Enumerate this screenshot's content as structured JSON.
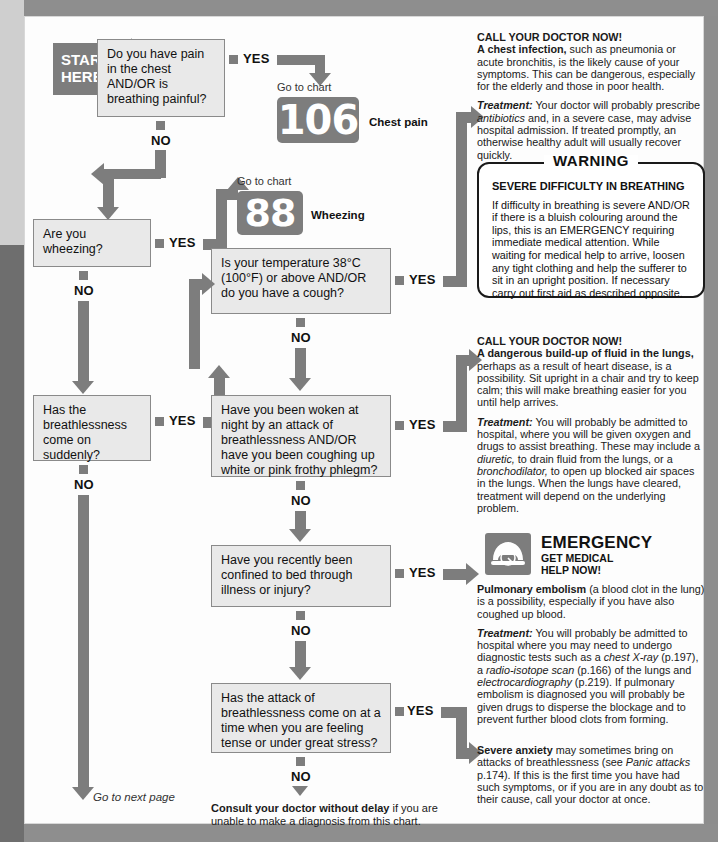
{
  "chart": {
    "start_label": "START\nHERE",
    "goto_next_page": "Go to next page",
    "yes": "YES",
    "no": "NO",
    "goto_chart": "Go to chart"
  },
  "questions": {
    "q1": "Do you have pain in the chest AND/OR is breathing painful?",
    "q2": "Are you wheezing?",
    "q3": "Is your temperature 38°C (100°F) or above AND/OR do you have a cough?",
    "q4": "Has the breathlessness come on suddenly?",
    "q5": "Have you been woken at night by an attack of breathlessness AND/OR have you been coughing up white or pink frothy phlegm?",
    "q6": "Have you recently been confined to bed through illness or injury?",
    "q7": "Has the attack of breathlessness come on at a time when you are feeling tense or under great stress?"
  },
  "refs": {
    "chart106_number": "106",
    "chart106_name": "Chest pain",
    "chart88_number": "88",
    "chart88_name": "Wheezing"
  },
  "advice": {
    "chest_infection": {
      "call": "CALL YOUR DOCTOR NOW!",
      "lead_bold": "A chest infection,",
      "lead_rest": " such as pneumonia or acute bronchitis, is the likely cause of your symptoms. This can be dangerous, especially for the elderly and those in poor health.",
      "treatment_label": "Treatment:",
      "treatment_1": " Your doctor will probably prescribe ",
      "treatment_italic": "antibiotics",
      "treatment_2": " and, in a severe case, may advise hospital admission. If treated promptly, an otherwise healthy adult will usually recover quickly."
    },
    "warning": {
      "title": "WARNING",
      "subtitle": "SEVERE DIFFICULTY IN BREATHING",
      "body": "If difficulty in breathing is severe AND/OR if there is a bluish colouring around the lips, this is an EMERGENCY requiring immediate medical attention. While waiting for medical help to arrive, loosen any tight clothing and help the sufferer to sit in an upright position. If necessary carry out first aid as described opposite."
    },
    "pulmonary_oedema": {
      "call": "CALL YOUR DOCTOR NOW!",
      "lead_bold": "A dangerous build-up of fluid in the lungs,",
      "lead_rest": " perhaps as a result of heart disease, is a possibility. Sit upright in a chair and try to keep calm; this will make breathing easier for you until help arrives.",
      "treatment_label": "Treatment:",
      "treatment_1": " You will probably be admitted to hospital, where you will be given oxygen and drugs to assist breathing. These may include a ",
      "treatment_italic_1": "diuretic,",
      "treatment_2": " to drain fluid from the lungs, or a ",
      "treatment_italic_2": "bronchodilator,",
      "treatment_3": " to open up blocked air spaces in the lungs. When the lungs have cleared, treatment will depend on the underlying problem."
    },
    "emergency": {
      "icon": "telephone-icon",
      "title": "EMERGENCY",
      "subtitle": "GET MEDICAL\nHELP NOW!",
      "lead_bold": "Pulmonary embolism",
      "lead_rest": " (a blood clot in the lung) is a possibility, especially if you have also coughed up blood.",
      "treatment_label": "Treatment:",
      "treatment_1": " You will probably be admitted to hospital where you may need to undergo diagnostic tests such as a ",
      "treatment_italic_1": "chest X-ray",
      "treatment_2": " (p.197), a ",
      "treatment_italic_2": "radio-isotope scan",
      "treatment_3": " (p.166) of the lungs and ",
      "treatment_italic_3": "electrocardiography",
      "treatment_4": " (p.219). If pulmonary embolism is diagnosed you will probably be given drugs to disperse the blockage and to prevent further blood clots from forming."
    },
    "anxiety": {
      "lead_bold": "Severe anxiety",
      "lead_rest_1": " may sometimes bring on attacks of breathlessness (see ",
      "lead_italic": "Panic attacks",
      "lead_rest_2": " p.174). If this is the first time you have had such symptoms, or if you are in any doubt as to their cause, call your doctor at once."
    }
  },
  "footer": {
    "consult_bold": "Consult your doctor without delay",
    "consult_rest": " if you are unable to make a diagnosis from this chart."
  },
  "colors": {
    "arrow_grey": "#7d7d7d",
    "box_fill": "#e9e9e9",
    "box_border": "#8a8a8a",
    "page_bg": "#8d8d8d",
    "sheet": "#fdfdfd"
  }
}
